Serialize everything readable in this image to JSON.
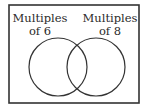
{
  "diagram": {
    "type": "venn",
    "sets": [
      {
        "label_line1": "Multiples",
        "label_line2": "of 6"
      },
      {
        "label_line1": "Multiples",
        "label_line2": "of 8"
      }
    ],
    "colors": {
      "stroke": "#333333",
      "background": "#ffffff"
    }
  }
}
